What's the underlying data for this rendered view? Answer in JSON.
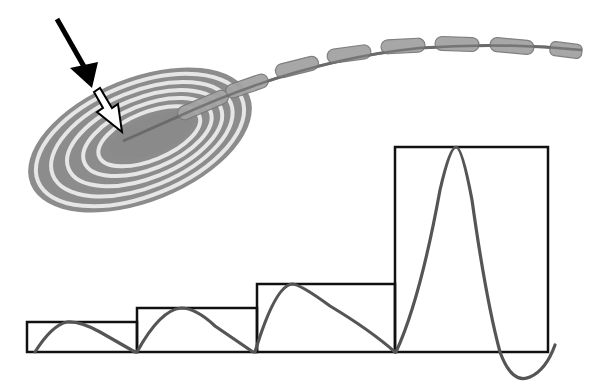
{
  "diagram": {
    "title": "",
    "colors": {
      "background": "#ffffff",
      "lamella_gray": "#8c8c8c",
      "lamella_light": "#e6e6e6",
      "core": "#8a8a8a",
      "axon": "#6a6a6a",
      "myelin": "#a3a3a3",
      "myelin_outline": "#7a7a7a",
      "box_stroke": "#111111",
      "waveform": "#555555",
      "arrow": "#000000"
    },
    "icons": {
      "solid_arrow": "solid-arrow-icon",
      "hollow_arrow": "hollow-arrow-icon"
    },
    "corpuscle": {
      "rings": 5,
      "cx": 140,
      "cy": 140,
      "rx": 118,
      "ry": 62,
      "rotate": -22
    },
    "axon": {
      "segments": 8
    },
    "steps": [
      {
        "x": 27,
        "y": 322,
        "width": 110,
        "height": 30
      },
      {
        "x": 137,
        "y": 308,
        "width": 120,
        "height": 44
      },
      {
        "x": 257,
        "y": 284,
        "width": 138,
        "height": 68
      },
      {
        "x": 395,
        "y": 147,
        "width": 153,
        "height": 205
      }
    ]
  }
}
